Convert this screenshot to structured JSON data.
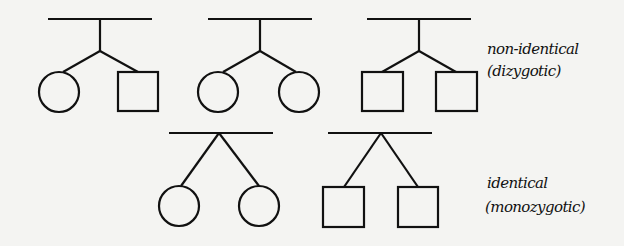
{
  "labels": {
    "non_identical": "non-identical",
    "dizygotic": "(dizygotic)",
    "identical": "identical",
    "monozygotic": "(monozygotic)"
  },
  "colors": {
    "line": "#111111",
    "background": "#f4f4f2"
  },
  "groups": [
    {
      "type": "non-identical",
      "children": [
        "female",
        "male"
      ]
    },
    {
      "type": "non-identical",
      "children": [
        "female",
        "female"
      ]
    },
    {
      "type": "non-identical",
      "children": [
        "male",
        "male"
      ]
    },
    {
      "type": "identical",
      "children": [
        "female",
        "female"
      ]
    },
    {
      "type": "identical",
      "children": [
        "male",
        "male"
      ]
    }
  ]
}
